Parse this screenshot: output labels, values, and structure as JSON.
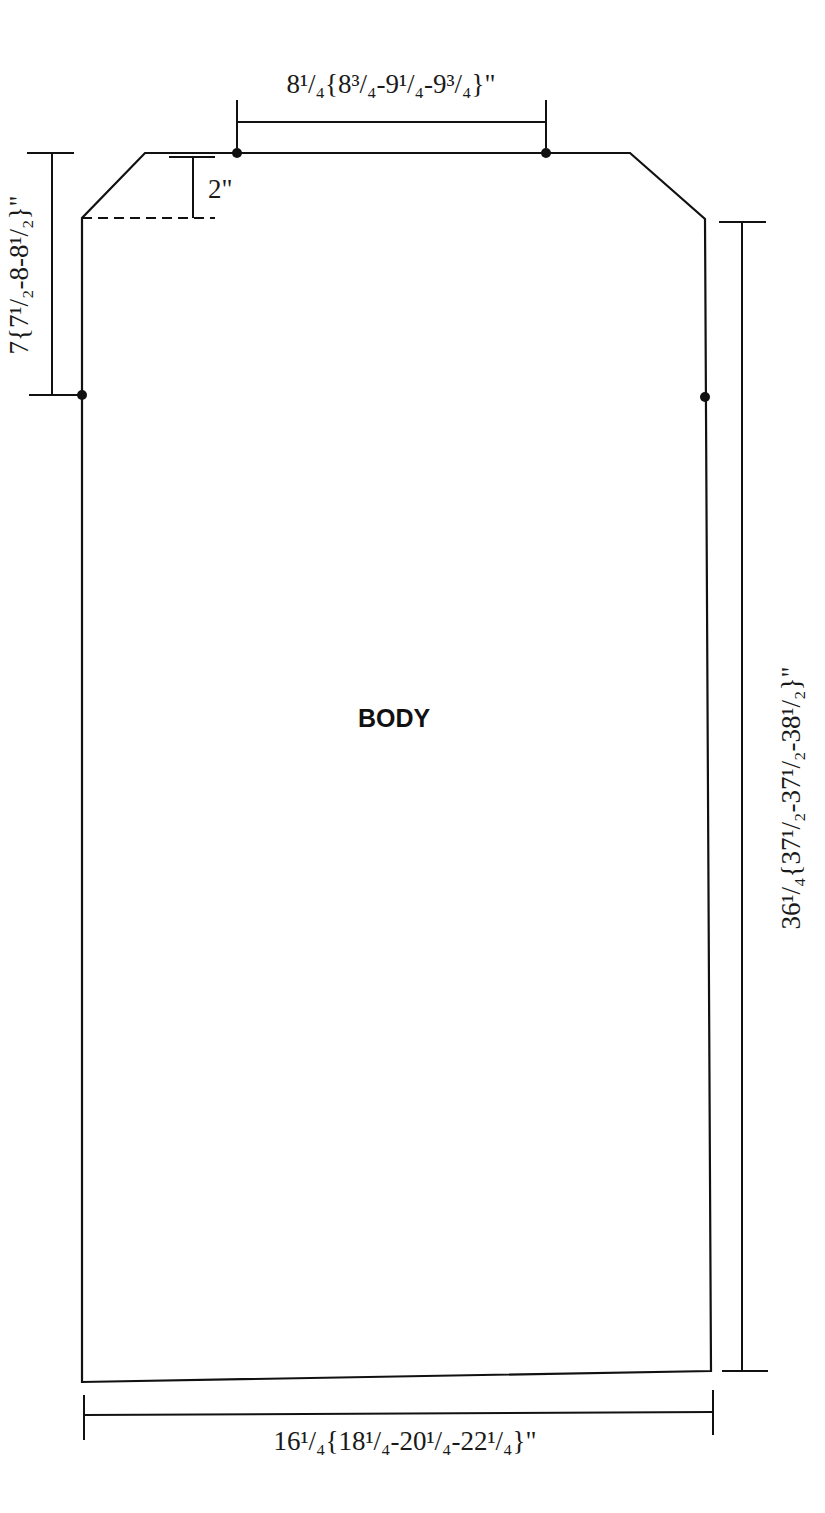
{
  "diagram": {
    "type": "knitting-schematic",
    "piece_label": "BODY",
    "colors": {
      "line": "#111111",
      "text": "#1a1a1a",
      "background": "#ffffff"
    },
    "measurements": {
      "neck_width": {
        "label": "8¹/₄{8³/₄-9¹/₄-9³/₄}\"",
        "position": "top"
      },
      "armhole_depth": {
        "label": "7{7¹/₂-8-8¹/₂}\"",
        "position": "left"
      },
      "shoulder_slope": {
        "label": "2\"",
        "position": "top-left-inner"
      },
      "length": {
        "label": "36¹/₄{37¹/₂-37¹/₂-38¹/₂}\"",
        "position": "right"
      },
      "width": {
        "label": "16¹/₄{18¹/₄-20¹/₄-22¹/₄}\"",
        "position": "bottom"
      }
    }
  }
}
